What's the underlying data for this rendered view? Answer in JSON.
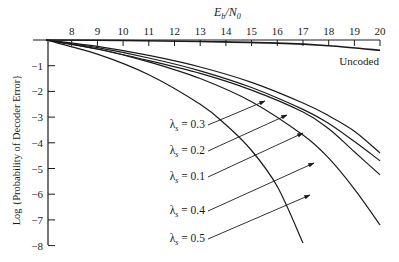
{
  "chart_data": {
    "type": "line",
    "title": "",
    "xlabel": "E_b/N_0",
    "xlabel_main": "E",
    "xlabel_sub1": "b",
    "xlabel_sep": "/N",
    "xlabel_sub2": "0",
    "ylabel": "Log {Probability of Decoder Error}",
    "xlim": [
      7,
      20
    ],
    "ylim": [
      -8,
      0
    ],
    "x_ticks": [
      8,
      9,
      10,
      11,
      12,
      13,
      14,
      15,
      16,
      17,
      18,
      19,
      20
    ],
    "y_ticks": [
      -1,
      -2,
      -3,
      -4,
      -5,
      -6,
      -7,
      -8
    ],
    "x_tick_labels": [
      "8",
      "9",
      "10",
      "11",
      "12",
      "13",
      "14",
      "15",
      "16",
      "17",
      "18",
      "19",
      "20"
    ],
    "y_tick_labels": [
      "−1",
      "−2",
      "−3",
      "−4",
      "−5",
      "−6",
      "−7",
      "−8"
    ],
    "grid": false,
    "x_axis_position": "top",
    "series": [
      {
        "name": "Uncoded",
        "label": "Uncoded",
        "x": [
          7,
          10,
          13,
          16,
          18,
          20
        ],
        "y": [
          0,
          -0.02,
          -0.06,
          -0.12,
          -0.22,
          -0.4
        ]
      },
      {
        "name": "λ_s = 0.3",
        "label": "λ_s = 0.3",
        "x": [
          7,
          9,
          11,
          13,
          15,
          17,
          18,
          19,
          20
        ],
        "y": [
          0,
          -0.25,
          -0.6,
          -1.05,
          -1.65,
          -2.45,
          -2.95,
          -3.55,
          -4.4
        ]
      },
      {
        "name": "λ_s = 0.2",
        "label": "λ_s = 0.2",
        "x": [
          7,
          9,
          11,
          13,
          15,
          17,
          18,
          19,
          20
        ],
        "y": [
          0,
          -0.3,
          -0.7,
          -1.2,
          -1.85,
          -2.7,
          -3.25,
          -3.95,
          -4.7
        ]
      },
      {
        "name": "λ_s = 0.1",
        "label": "λ_s = 0.1",
        "x": [
          7,
          9,
          11,
          13,
          15,
          17,
          18,
          19,
          20
        ],
        "y": [
          0,
          -0.35,
          -0.8,
          -1.3,
          -1.95,
          -2.8,
          -3.45,
          -4.35,
          -5.25
        ]
      },
      {
        "name": "λ_s = 0.4",
        "label": "λ_s = 0.4",
        "x": [
          7,
          9,
          11,
          13,
          15,
          17,
          18,
          19,
          20
        ],
        "y": [
          0,
          -0.35,
          -0.85,
          -1.5,
          -2.4,
          -3.7,
          -4.6,
          -5.8,
          -7.2
        ]
      },
      {
        "name": "λ_s = 0.5",
        "label": "λ_s = 0.5",
        "x": [
          7,
          9,
          11,
          13,
          14,
          15,
          16,
          17
        ],
        "y": [
          0,
          -0.55,
          -1.35,
          -2.5,
          -3.3,
          -4.3,
          -5.7,
          -7.9
        ]
      }
    ],
    "annotations": [
      {
        "text": "λ_s = 0.3",
        "lambda": "λ",
        "sub": "s",
        "value": "= 0.3"
      },
      {
        "text": "λ_s = 0.2",
        "lambda": "λ",
        "sub": "s",
        "value": "= 0.2"
      },
      {
        "text": "λ_s = 0.1",
        "lambda": "λ",
        "sub": "s",
        "value": "= 0.1"
      },
      {
        "text": "λ_s = 0.4",
        "lambda": "λ",
        "sub": "s",
        "value": "= 0.4"
      },
      {
        "text": "λ_s = 0.5",
        "lambda": "λ",
        "sub": "s",
        "value": "= 0.5"
      },
      {
        "text": "Uncoded"
      }
    ],
    "legend": "inline annotations with arrows",
    "colors": {
      "line": "#1a1a1a",
      "background": "#ffffff"
    }
  }
}
